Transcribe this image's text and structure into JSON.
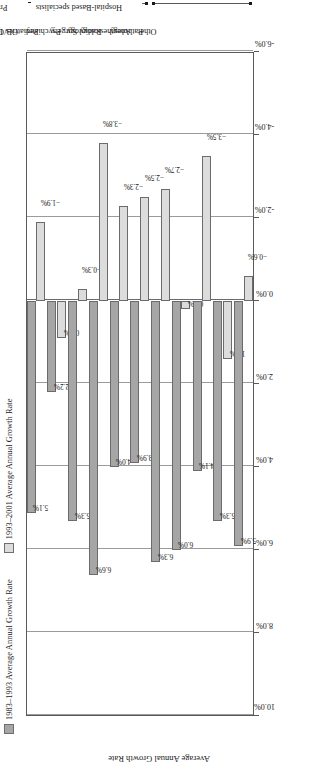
{
  "chart_data": {
    "type": "bar",
    "title": "",
    "xlabel": "",
    "ylabel": "Average Annual Growth Rate",
    "ylim": [
      -6.0,
      10.0
    ],
    "ytick_labels": [
      "10.0%",
      "8.0%",
      "6.0%",
      "4.0%",
      "2.0%",
      "0.0%",
      "-2.0%",
      "-4.0%",
      "-6.0%"
    ],
    "ytick_values": [
      10.0,
      8.0,
      6.0,
      4.0,
      2.0,
      0.0,
      -2.0,
      -4.0,
      -6.0
    ],
    "grid": true,
    "legend_position": "top-left",
    "orientation": "vertical-bars",
    "categories": [
      "All Doctors",
      "GP/FP",
      "Internal Med",
      "OB/GYN",
      "Pediatrics",
      "Psychiatry",
      "Surgery",
      "Radiology",
      "Anesthesiology",
      "Pathology",
      "Other"
    ],
    "series": [
      {
        "name": "1983–1993 Average Annual Growth Rate",
        "color": "#a6a6a6",
        "values": [
          5.1,
          2.2,
          5.3,
          6.6,
          4.0,
          3.9,
          6.3,
          6.0,
          4.1,
          5.3,
          5.9
        ],
        "labels": [
          "5.1%",
          "2.2%",
          "5.3%",
          "6.6%",
          "4.0%",
          "3.9%",
          "6.3%",
          "6.0%",
          "4.1%",
          "5.3%",
          "5.9%"
        ]
      },
      {
        "name": "1993–2001 Average Annual Growth Rate",
        "color": "#dcdcdc",
        "values": [
          -1.9,
          0.9,
          -0.3,
          -3.8,
          -2.3,
          -2.5,
          -2.7,
          0.2,
          -3.5,
          1.4,
          -0.6
        ],
        "labels": [
          "-1.9%",
          "0.9%",
          "-0.3%",
          "-3.8%",
          "-2.3%",
          "-2.5%",
          "-2.7%",
          "0.2%",
          "-3.5%",
          "1.4%",
          "-0.6%"
        ]
      }
    ],
    "group_brackets": [
      {
        "label": "Practice-Based specialists",
        "from": "All Doctors",
        "to": "Psychiatry"
      },
      {
        "label": "Hospital-Based specialists",
        "from": "Surgery",
        "to": "Other"
      }
    ]
  }
}
